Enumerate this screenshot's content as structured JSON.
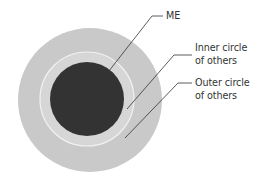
{
  "diagram": {
    "type": "concentric-circles",
    "colors": {
      "background": "#ffffff",
      "outer_circle": "#c9c9c9",
      "inner_circle": "#d6d6d6",
      "inner_circle_border": "#f2f2f2",
      "me_circle": "#333333",
      "leader_line": "#333333",
      "text": "#333333"
    },
    "circles": [
      {
        "id": "outer",
        "cx": 90,
        "cy": 100,
        "r": 72
      },
      {
        "id": "inner",
        "cx": 87,
        "cy": 99,
        "r": 47
      },
      {
        "id": "me",
        "cx": 87,
        "cy": 99,
        "r": 37
      }
    ],
    "labels": {
      "me": {
        "lines": [
          "ME"
        ]
      },
      "inner": {
        "lines": [
          "Inner circle",
          "of others"
        ]
      },
      "outer": {
        "lines": [
          "Outer circle",
          "of others"
        ]
      }
    }
  }
}
